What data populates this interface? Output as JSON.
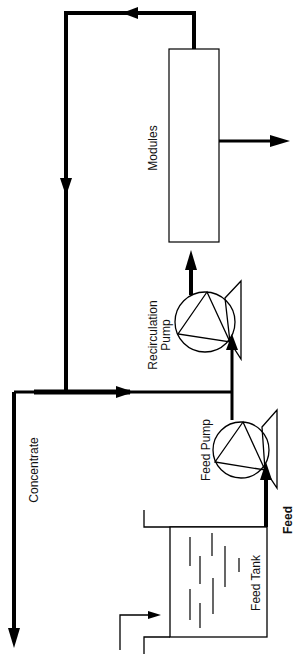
{
  "diagram": {
    "type": "process-flow",
    "orientation": "rotated 90deg (text reads bottom-to-top)",
    "labels": {
      "modules": "Modules",
      "recirculation_pump_line1": "Recirculation",
      "recirculation_pump_line2": "Pump",
      "feed_pump": "Feed Pump",
      "concentrate": "Concentrate",
      "feed_tank": "Feed Tank",
      "feed": "Feed"
    },
    "components": [
      {
        "id": "feed-tank",
        "label": "Feed Tank"
      },
      {
        "id": "feed-pump",
        "label": "Feed Pump"
      },
      {
        "id": "recirculation-pump",
        "label": "Recirculation Pump"
      },
      {
        "id": "modules",
        "label": "Modules"
      }
    ],
    "flows": [
      {
        "from": "feed-tank",
        "to": "feed-pump",
        "label": "Feed"
      },
      {
        "from": "feed-pump",
        "to": "recirculation-pump"
      },
      {
        "from": "recirculation-pump",
        "to": "modules"
      },
      {
        "from": "modules",
        "to": "recirculation-loop",
        "label": "retentate return"
      },
      {
        "from": "recirculation-loop",
        "to": "outlet",
        "label": "Concentrate"
      },
      {
        "from": "modules",
        "to": "outlet",
        "label": "permeate"
      },
      {
        "from": "inlet",
        "to": "feed-tank"
      }
    ],
    "colors": {
      "line": "#000000",
      "background": "#ffffff"
    }
  }
}
